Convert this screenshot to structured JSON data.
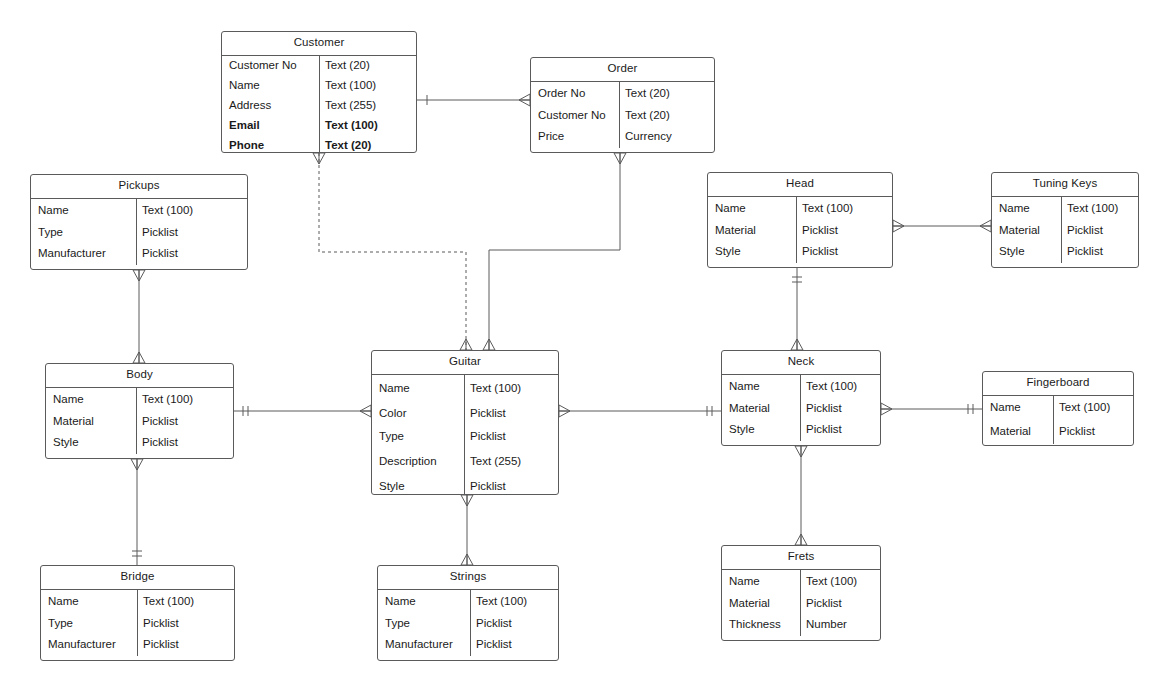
{
  "diagram": {
    "notation": "crow's foot",
    "background_color": "#ffffff",
    "line_color": "#5a5a5a",
    "text_color": "#1a1a1a"
  },
  "entities": [
    {
      "id": "customer",
      "name": "Customer",
      "x": 221,
      "y": 31,
      "w": 196,
      "h": 122,
      "split": 97,
      "rows": [
        {
          "name": "Customer No",
          "type": "Text (20)",
          "bold": false,
          "h": 20
        },
        {
          "name": "Name",
          "type": "Text (100)",
          "bold": false,
          "h": 20
        },
        {
          "name": "Address",
          "type": "Text (255)",
          "bold": false,
          "h": 20
        },
        {
          "name": "Email",
          "type": "Text (100)",
          "bold": true,
          "h": 20
        },
        {
          "name": "Phone",
          "type": "Text (20)",
          "bold": true,
          "h": 20
        }
      ]
    },
    {
      "id": "order",
      "name": "Order",
      "x": 530,
      "y": 57,
      "w": 185,
      "h": 96,
      "split": 88,
      "rows": [
        {
          "name": "Order No",
          "type": "Text (20)",
          "bold": false,
          "h": 24
        },
        {
          "name": "Customer No",
          "type": "Text (20)",
          "bold": false,
          "h": 21
        },
        {
          "name": "Price",
          "type": "Currency",
          "bold": false,
          "h": 21
        }
      ]
    },
    {
      "id": "pickups",
      "name": "Pickups",
      "x": 30,
      "y": 174,
      "w": 218,
      "h": 96,
      "split": 105,
      "rows": [
        {
          "name": "Name",
          "type": "Text (100)",
          "bold": false,
          "h": 24
        },
        {
          "name": "Type",
          "type": "Picklist",
          "bold": false,
          "h": 21
        },
        {
          "name": "Manufacturer",
          "type": "Picklist",
          "bold": false,
          "h": 21
        }
      ]
    },
    {
      "id": "head",
      "name": "Head",
      "x": 707,
      "y": 172,
      "w": 186,
      "h": 96,
      "split": 88,
      "rows": [
        {
          "name": "Name",
          "type": "Text (100)",
          "bold": false,
          "h": 24
        },
        {
          "name": "Material",
          "type": "Picklist",
          "bold": false,
          "h": 21
        },
        {
          "name": "Style",
          "type": "Picklist",
          "bold": false,
          "h": 21
        }
      ]
    },
    {
      "id": "tuningkeys",
      "name": "Tuning Keys",
      "x": 991,
      "y": 172,
      "w": 148,
      "h": 96,
      "split": 69,
      "rows": [
        {
          "name": "Name",
          "type": "Text (100)",
          "bold": false,
          "h": 24
        },
        {
          "name": "Material",
          "type": "Picklist",
          "bold": false,
          "h": 21
        },
        {
          "name": "Style",
          "type": "Picklist",
          "bold": false,
          "h": 21
        }
      ]
    },
    {
      "id": "body",
      "name": "Body",
      "x": 45,
      "y": 363,
      "w": 189,
      "h": 96,
      "split": 90,
      "rows": [
        {
          "name": "Name",
          "type": "Text (100)",
          "bold": false,
          "h": 24
        },
        {
          "name": "Material",
          "type": "Picklist",
          "bold": false,
          "h": 21
        },
        {
          "name": "Style",
          "type": "Picklist",
          "bold": false,
          "h": 21
        }
      ]
    },
    {
      "id": "guitar",
      "name": "Guitar",
      "x": 371,
      "y": 350,
      "w": 188,
      "h": 145,
      "split": 92,
      "rows": [
        {
          "name": "Name",
          "type": "Text (100)",
          "bold": false,
          "h": 28
        },
        {
          "name": "Color",
          "type": "Picklist",
          "bold": false,
          "h": 23
        },
        {
          "name": "Type",
          "type": "Picklist",
          "bold": false,
          "h": 23
        },
        {
          "name": "Description",
          "type": "Text (255)",
          "bold": false,
          "h": 26
        },
        {
          "name": "Style",
          "type": "Picklist",
          "bold": false,
          "h": 24
        }
      ]
    },
    {
      "id": "neck",
      "name": "Neck",
      "x": 721,
      "y": 350,
      "w": 160,
      "h": 96,
      "split": 78,
      "rows": [
        {
          "name": "Name",
          "type": "Text (100)",
          "bold": false,
          "h": 24
        },
        {
          "name": "Material",
          "type": "Picklist",
          "bold": false,
          "h": 21
        },
        {
          "name": "Style",
          "type": "Picklist",
          "bold": false,
          "h": 21
        }
      ]
    },
    {
      "id": "fingerboard",
      "name": "Fingerboard",
      "x": 982,
      "y": 371,
      "w": 152,
      "h": 75,
      "split": 70,
      "rows": [
        {
          "name": "Name",
          "type": "Text (100)",
          "bold": false,
          "h": 24
        },
        {
          "name": "Material",
          "type": "Picklist",
          "bold": false,
          "h": 24
        }
      ]
    },
    {
      "id": "bridge",
      "name": "Bridge",
      "x": 40,
      "y": 565,
      "w": 195,
      "h": 96,
      "split": 96,
      "rows": [
        {
          "name": "Name",
          "type": "Text (100)",
          "bold": false,
          "h": 24
        },
        {
          "name": "Type",
          "type": "Picklist",
          "bold": false,
          "h": 21
        },
        {
          "name": "Manufacturer",
          "type": "Picklist",
          "bold": false,
          "h": 21
        }
      ]
    },
    {
      "id": "strings",
      "name": "Strings",
      "x": 377,
      "y": 565,
      "w": 182,
      "h": 96,
      "split": 92,
      "rows": [
        {
          "name": "Name",
          "type": "Text (100)",
          "bold": false,
          "h": 24
        },
        {
          "name": "Type",
          "type": "Picklist",
          "bold": false,
          "h": 21
        },
        {
          "name": "Manufacturer",
          "type": "Picklist",
          "bold": false,
          "h": 21
        }
      ]
    },
    {
      "id": "frets",
      "name": "Frets",
      "x": 721,
      "y": 545,
      "w": 160,
      "h": 96,
      "split": 78,
      "rows": [
        {
          "name": "Name",
          "type": "Text (100)",
          "bold": false,
          "h": 24
        },
        {
          "name": "Material",
          "type": "Picklist",
          "bold": false,
          "h": 21
        },
        {
          "name": "Thickness",
          "type": "Number",
          "bold": false,
          "h": 21
        }
      ]
    }
  ],
  "relationships": [
    {
      "id": "customer-order",
      "from": "Customer",
      "to": "Order",
      "style": "solid",
      "points": [
        [
          417,
          100
        ],
        [
          530,
          100
        ]
      ],
      "from_marker": "one",
      "to_marker": "many"
    },
    {
      "id": "customer-guitar",
      "from": "Customer",
      "to": "Guitar",
      "style": "dashed",
      "points": [
        [
          319,
          153
        ],
        [
          319,
          252
        ],
        [
          466,
          252
        ],
        [
          466,
          350
        ]
      ],
      "from_marker": "many",
      "to_marker": "many"
    },
    {
      "id": "order-guitar",
      "from": "Order",
      "to": "Guitar",
      "style": "solid",
      "points": [
        [
          620,
          153
        ],
        [
          620,
          250
        ],
        [
          489,
          250
        ],
        [
          489,
          350
        ]
      ],
      "from_marker": "many",
      "to_marker": "many"
    },
    {
      "id": "pickups-body",
      "from": "Pickups",
      "to": "Body",
      "style": "solid",
      "points": [
        [
          139,
          270
        ],
        [
          139,
          363
        ]
      ],
      "from_marker": "many",
      "to_marker": "many"
    },
    {
      "id": "body-guitar",
      "from": "Body",
      "to": "Guitar",
      "style": "solid",
      "points": [
        [
          234,
          411
        ],
        [
          371,
          411
        ]
      ],
      "from_marker": "one-only",
      "to_marker": "many"
    },
    {
      "id": "body-bridge",
      "from": "Body",
      "to": "Bridge",
      "style": "solid",
      "points": [
        [
          137,
          459
        ],
        [
          137,
          565
        ]
      ],
      "from_marker": "many",
      "to_marker": "one-only"
    },
    {
      "id": "guitar-strings",
      "from": "Guitar",
      "to": "Strings",
      "style": "solid",
      "points": [
        [
          467,
          495
        ],
        [
          467,
          565
        ]
      ],
      "from_marker": "many",
      "to_marker": "many"
    },
    {
      "id": "guitar-neck",
      "from": "Guitar",
      "to": "Neck",
      "style": "solid",
      "points": [
        [
          559,
          411
        ],
        [
          721,
          411
        ]
      ],
      "from_marker": "many",
      "to_marker": "one-only"
    },
    {
      "id": "head-neck",
      "from": "Head",
      "to": "Neck",
      "style": "solid",
      "points": [
        [
          797,
          268
        ],
        [
          797,
          350
        ]
      ],
      "from_marker": "one-only",
      "to_marker": "many"
    },
    {
      "id": "head-tuningkeys",
      "from": "Head",
      "to": "Tuning Keys",
      "style": "solid",
      "points": [
        [
          893,
          226
        ],
        [
          991,
          226
        ]
      ],
      "from_marker": "many",
      "to_marker": "many"
    },
    {
      "id": "neck-fingerboard",
      "from": "Neck",
      "to": "Fingerboard",
      "style": "solid",
      "points": [
        [
          881,
          409
        ],
        [
          982,
          409
        ]
      ],
      "from_marker": "many",
      "to_marker": "one-only"
    },
    {
      "id": "neck-frets",
      "from": "Neck",
      "to": "Frets",
      "style": "solid",
      "points": [
        [
          801,
          446
        ],
        [
          801,
          545
        ]
      ],
      "from_marker": "many",
      "to_marker": "many"
    }
  ]
}
